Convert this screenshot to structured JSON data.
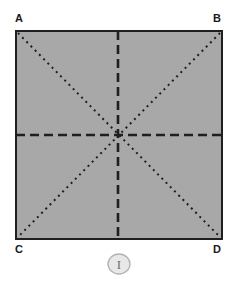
{
  "figure": {
    "background_color": "#ffffff",
    "sheet": {
      "fill_color": "#a8a8a8",
      "border_color": "#1f1f1f",
      "border_width": 2,
      "x": 15,
      "y": 30,
      "width": 208,
      "height": 210
    },
    "corner_labels": [
      {
        "id": "A",
        "text": "A",
        "position": "top-left"
      },
      {
        "id": "B",
        "text": "B",
        "position": "top-right"
      },
      {
        "id": "C",
        "text": "C",
        "position": "bottom-left"
      },
      {
        "id": "D",
        "text": "D",
        "position": "bottom-right"
      }
    ],
    "fold_lines": [
      {
        "id": "diagonal-ad",
        "style": "dotted",
        "color": "#1f1f1f",
        "from": "A",
        "to": "D",
        "x1": 18,
        "y1": 33,
        "x2": 220,
        "y2": 237
      },
      {
        "id": "diagonal-bc",
        "style": "dotted",
        "color": "#1f1f1f",
        "from": "B",
        "to": "C",
        "x1": 220,
        "y1": 33,
        "x2": 18,
        "y2": 237
      },
      {
        "id": "vertical-median",
        "style": "dashed",
        "color": "#1f1f1f",
        "x1": 118,
        "y1": 31,
        "x2": 118,
        "y2": 239
      },
      {
        "id": "horizontal-median",
        "style": "dashed",
        "color": "#1f1f1f",
        "x1": 16,
        "y1": 135,
        "x2": 222,
        "y2": 135
      }
    ],
    "badge": {
      "text": "I",
      "fill_color": "#e8e8e8",
      "border_color": "#b4b4b4",
      "text_color": "#6e6e6e",
      "cx": 119,
      "cy": 264,
      "rx": 11,
      "ry": 10
    }
  }
}
